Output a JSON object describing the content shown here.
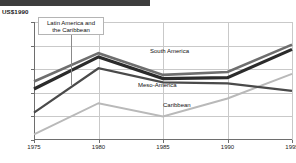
{
  "header": {
    "bar_text": "",
    "bar_color": "#3d3d3d"
  },
  "axis": {
    "unit_label": "US$1990"
  },
  "annotation": {
    "text_line1": "Latin America and",
    "text_line2": "the Caribbean"
  },
  "chart_data": {
    "type": "line",
    "title": "",
    "subtitle": "",
    "xlabel": "",
    "ylabel": "US$1990",
    "x": [
      1975,
      1980,
      1985,
      1990,
      1995
    ],
    "xtick_labels": [
      "1975",
      "1980",
      "1985",
      "1990",
      "1995"
    ],
    "ytick_labels": [
      "3 250",
      "3 000",
      "2 750",
      "2 500",
      "2 250",
      "2 000"
    ],
    "ytick_values": [
      3250,
      3000,
      2750,
      2500,
      2250,
      2000
    ],
    "ylim": [
      2000,
      3250
    ],
    "xlim": [
      1975,
      1995
    ],
    "grid": true,
    "legend": "inline-labels",
    "series": [
      {
        "name": "Latin America and the Caribbean",
        "color": "#6e6e6e",
        "width": 2.6,
        "label_style": "boxed-annotation",
        "values": [
          2620,
          2920,
          2690,
          2720,
          3010
        ]
      },
      {
        "name": "South America",
        "color": "#2b2b2b",
        "width": 3.2,
        "label_style": "inline",
        "values": [
          2540,
          2880,
          2650,
          2660,
          2960
        ]
      },
      {
        "name": "Meso-America",
        "color": "#4a4a4a",
        "width": 2.2,
        "label_style": "inline",
        "values": [
          2290,
          2760,
          2610,
          2600,
          2520
        ]
      },
      {
        "name": "Caribbean",
        "color": "#b9b9b9",
        "width": 2.0,
        "label_style": "inline",
        "values": [
          2060,
          2390,
          2250,
          2440,
          2700
        ]
      }
    ]
  },
  "series_labels": {
    "south_america": "South America",
    "meso_america": "Meso-America",
    "caribbean": "Caribbean"
  }
}
